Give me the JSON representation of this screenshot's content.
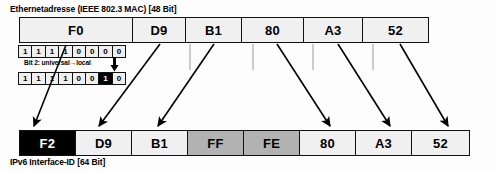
{
  "diagram": {
    "title_top": "Ethernetadresse (IEEE 802.3 MAC) [48 Bit]",
    "title_bottom": "IPv6 Interface-ID [64 Bit]",
    "bit_note": "Bit 2: universal→local",
    "colors": {
      "cell_fill": "#f0f0f0",
      "shaded_fill": "#b2b2b2",
      "inverted_fill": "#000000",
      "border": "#111111",
      "background": "#fdfdfd"
    },
    "mac_bytes": [
      {
        "value": "F0",
        "style": "normal",
        "width": 114
      },
      {
        "value": "D9",
        "style": "normal",
        "width": 54
      },
      {
        "value": "B1",
        "style": "normal",
        "width": 57
      },
      {
        "value": "80",
        "style": "normal",
        "width": 63
      },
      {
        "value": "A3",
        "style": "normal",
        "width": 60
      },
      {
        "value": "52",
        "style": "normal",
        "width": 67
      }
    ],
    "interface_id_bytes": [
      {
        "value": "F2",
        "style": "inverted",
        "width": 57
      },
      {
        "value": "D9",
        "style": "normal",
        "width": 57
      },
      {
        "value": "B1",
        "style": "normal",
        "width": 57
      },
      {
        "value": "FF",
        "style": "shaded",
        "width": 57
      },
      {
        "value": "FE",
        "style": "shaded",
        "width": 57
      },
      {
        "value": "80",
        "style": "normal",
        "width": 57
      },
      {
        "value": "A3",
        "style": "normal",
        "width": 57
      },
      {
        "value": "52",
        "style": "normal",
        "width": 59
      }
    ],
    "bits_before": [
      "1",
      "1",
      "1",
      "1",
      "0",
      "0",
      "0",
      "0"
    ],
    "bits_after": [
      "1",
      "1",
      "1",
      "1",
      "0",
      "0",
      "1",
      "0"
    ],
    "highlighted_bit_index": 6
  }
}
